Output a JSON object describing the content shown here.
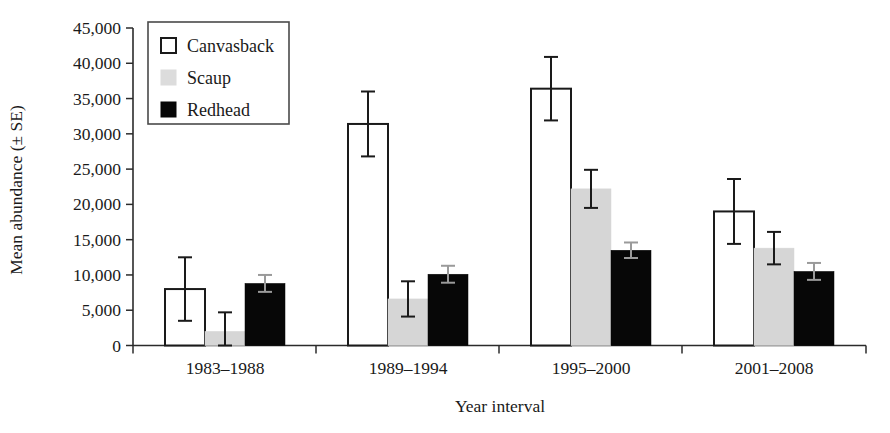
{
  "chart_data": {
    "type": "bar",
    "title": "",
    "xlabel": "Year interval",
    "ylabel": "Mean abundance (± SE)",
    "categories": [
      "1983–1988",
      "1989–1994",
      "1995–2000",
      "2001–2008"
    ],
    "ylim": [
      0,
      45000
    ],
    "ytick_values": [
      0,
      5000,
      10000,
      15000,
      20000,
      25000,
      30000,
      35000,
      40000,
      45000
    ],
    "ytick_labels": [
      "0",
      "5,000",
      "10,000",
      "15,000",
      "20,000",
      "25,000",
      "30,000",
      "35,000",
      "40,000",
      "45,000"
    ],
    "grid": false,
    "legend_position": "upper-left-inside",
    "error_type": "SE",
    "series": [
      {
        "name": "Canvasback",
        "color": "#ffffff",
        "edge_color": "#1a1a1a",
        "values": [
          8000,
          31400,
          36400,
          19000
        ],
        "errors": [
          4500,
          4600,
          4500,
          4600
        ]
      },
      {
        "name": "Scaup",
        "color": "#d6d6d6",
        "edge_color": "#d6d6d6",
        "values": [
          2000,
          6600,
          22200,
          13800
        ],
        "errors": [
          2700,
          2500,
          2700,
          2300
        ]
      },
      {
        "name": "Redhead",
        "color": "#070707",
        "edge_color": "#070707",
        "values": [
          8800,
          10100,
          13500,
          10500
        ],
        "errors": [
          1200,
          1200,
          1100,
          1200
        ]
      }
    ]
  },
  "legend": {
    "entries": [
      {
        "label": "Canvasback",
        "swatch": "open-square-swatch"
      },
      {
        "label": "Scaup",
        "swatch": "gray-square-swatch"
      },
      {
        "label": "Redhead",
        "swatch": "black-square-swatch"
      }
    ]
  },
  "axes": {
    "y_title": "Mean abundance (± SE)",
    "x_title": "Year interval"
  }
}
